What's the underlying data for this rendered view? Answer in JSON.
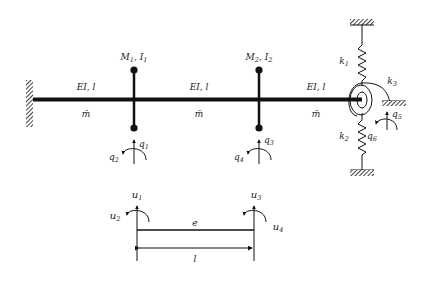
{
  "diagram": {
    "type": "structural-dynamics-model",
    "colors": {
      "stroke": "#111111",
      "label": "#222222",
      "background": "#ffffff"
    },
    "beam": {
      "segments": [
        {
          "stiffness_label": "EI, l",
          "mass_label": "m̄"
        },
        {
          "stiffness_label": "EI, l",
          "mass_label": "m̄"
        },
        {
          "stiffness_label": "EI, l",
          "mass_label": "m̄"
        }
      ],
      "left_support": "fixed-wall",
      "right_support": "spring-supported"
    },
    "lumped_masses": [
      {
        "label_M": "M",
        "sub_M": "1",
        "label_I": "I",
        "sub_I": "1"
      },
      {
        "label_M": "M",
        "sub_M": "2",
        "label_I": "I",
        "sub_I": "2"
      }
    ],
    "dofs": [
      {
        "name": "q",
        "sub": "1",
        "kind": "translation"
      },
      {
        "name": "q",
        "sub": "2",
        "kind": "rotation"
      },
      {
        "name": "q",
        "sub": "3",
        "kind": "translation"
      },
      {
        "name": "q",
        "sub": "4",
        "kind": "rotation"
      },
      {
        "name": "q",
        "sub": "5",
        "kind": "translation"
      },
      {
        "name": "q",
        "sub": "6",
        "kind": "rotation"
      }
    ],
    "springs": [
      {
        "name": "k",
        "sub": "1",
        "kind": "translational-top"
      },
      {
        "name": "k",
        "sub": "2",
        "kind": "translational-bottom"
      },
      {
        "name": "k",
        "sub": "3",
        "kind": "rotational"
      }
    ],
    "element": {
      "label": "e",
      "length_label": "l",
      "dofs": [
        {
          "name": "u",
          "sub": "1",
          "kind": "translation"
        },
        {
          "name": "u",
          "sub": "2",
          "kind": "rotation"
        },
        {
          "name": "u",
          "sub": "3",
          "kind": "translation"
        },
        {
          "name": "u",
          "sub": "4",
          "kind": "rotation"
        }
      ]
    }
  }
}
